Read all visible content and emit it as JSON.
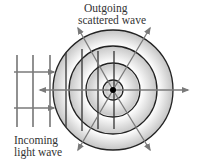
{
  "labels": {
    "outgoing": [
      "Outgoing",
      "scattered wave"
    ],
    "incoming": [
      "Incoming",
      "light wave"
    ]
  },
  "colors": {
    "ring_stroke": "#222222",
    "arrow": "#7a7a7a",
    "wave_line": "#555555",
    "fill_light": "#ffffff",
    "fill_dark": "#c8c8c8",
    "center_dot": "#000000"
  },
  "geometry": {
    "center": [
      113,
      90
    ],
    "ring_radii": [
      60,
      44,
      27,
      10
    ],
    "incoming_wave_x": [
      17,
      33,
      50
    ],
    "interior_wave_x": [
      66,
      82,
      98,
      114
    ],
    "incoming_arrow_y": [
      72,
      108
    ],
    "scatter_arrow_tips": [
      [
        78,
        28
      ],
      [
        150,
        28
      ],
      [
        78,
        150
      ],
      [
        150,
        150
      ],
      [
        40,
        90
      ],
      [
        188,
        90
      ]
    ]
  }
}
